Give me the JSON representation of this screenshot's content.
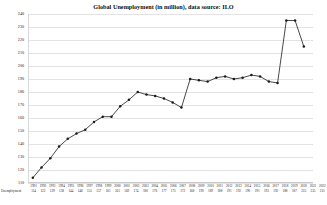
{
  "chart_data": {
    "type": "line",
    "title": "Global Unemployment (in million), data source: ILO",
    "xlabel": "",
    "ylabel": "",
    "ylim": [
      110,
      240
    ],
    "yticks": [
      240,
      230,
      220,
      210,
      200,
      190,
      180,
      170,
      160,
      150,
      140,
      130,
      120,
      110
    ],
    "grid": true,
    "legend": false,
    "marker": "circle",
    "line_color": "#1a1a1a",
    "categories": [
      "1991",
      "1992",
      "1993",
      "1994",
      "1995",
      "1996",
      "1997",
      "1998",
      "1999",
      "2000",
      "2001",
      "2002",
      "2003",
      "2004",
      "2005",
      "2006",
      "2007",
      "2008",
      "2009",
      "2010",
      "2011",
      "2012",
      "2013",
      "2014",
      "2015",
      "2016",
      "2017",
      "2018",
      "2019",
      "2020",
      "2021",
      "2022"
    ],
    "values": [
      114,
      122,
      129,
      138,
      144,
      148,
      151,
      157,
      161,
      161,
      169,
      174,
      180,
      178,
      177,
      175,
      172,
      168,
      190,
      189,
      188,
      191,
      192,
      190,
      191,
      193,
      192,
      188,
      187,
      235,
      235,
      215
    ],
    "series": [
      {
        "name": "Unemployment",
        "values": [
          114,
          122,
          129,
          138,
          144,
          148,
          151,
          157,
          161,
          161,
          169,
          174,
          180,
          178,
          177,
          175,
          172,
          168,
          190,
          189,
          188,
          191,
          192,
          190,
          191,
          193,
          192,
          188,
          187,
          235,
          235,
          215
        ]
      }
    ]
  },
  "table": {
    "row_label": "Unemployment"
  }
}
